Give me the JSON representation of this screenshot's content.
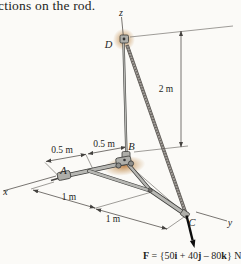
{
  "page": {
    "fragment_text": "ctions on the rod."
  },
  "figure": {
    "axes": {
      "x": "x",
      "y": "y",
      "z": "z"
    },
    "points": {
      "a": "A",
      "b": "B",
      "c": "C",
      "d": "D"
    },
    "dims": {
      "pole": "2 m",
      "rod1": "0.5 m",
      "rod2": "0.5 m",
      "base1": "1 m",
      "base2": "1 m"
    },
    "force": {
      "text": "F = {50i + 40j – 80k} N",
      "segments": [
        {
          "text": "F",
          "bold": true
        },
        {
          "text": " = {50",
          "bold": false
        },
        {
          "text": "i",
          "bold": true
        },
        {
          "text": " + 40",
          "bold": false
        },
        {
          "text": "j",
          "bold": true
        },
        {
          "text": " – 80",
          "bold": false
        },
        {
          "text": "k",
          "bold": true
        },
        {
          "text": "} N",
          "bold": false
        }
      ]
    },
    "colors": {
      "glow": "#c08a4a",
      "metal_light": "#b7b7b3",
      "metal_dark": "#3f3f3d",
      "line": "#55524e",
      "text": "#1e1e1c",
      "force": "#0d0d0d",
      "background": "#fbfaf7"
    }
  }
}
